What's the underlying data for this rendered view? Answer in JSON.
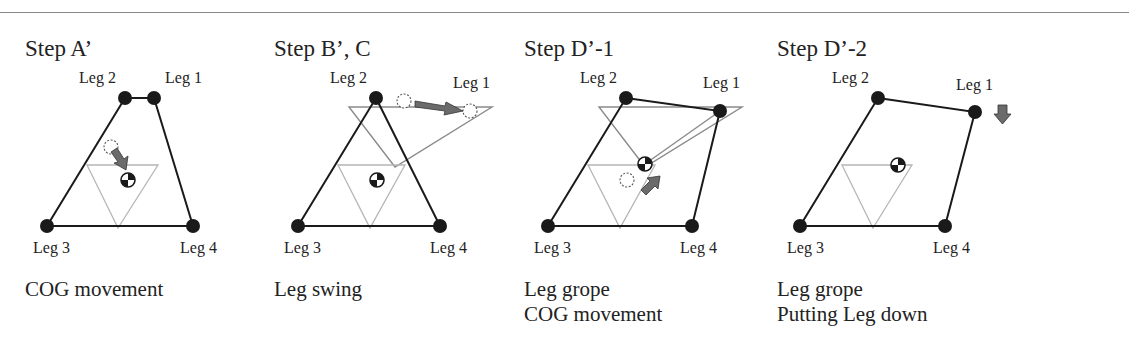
{
  "figure": {
    "panels": [
      {
        "id": "A",
        "title": "Step A’",
        "captions": [
          "COG movement"
        ],
        "legs": {
          "leg1": "Leg 1",
          "leg2": "Leg 2",
          "leg3": "Leg 3",
          "leg4": "Leg 4"
        }
      },
      {
        "id": "B",
        "title": "Step B’, C",
        "captions": [
          "Leg swing"
        ],
        "legs": {
          "leg1": "Leg 1",
          "leg2": "Leg 2",
          "leg3": "Leg 3",
          "leg4": "Leg 4"
        }
      },
      {
        "id": "D1",
        "title": "Step D’-1",
        "captions": [
          "Leg grope",
          "COG movement"
        ],
        "legs": {
          "leg1": "Leg 1",
          "leg2": "Leg 2",
          "leg3": "Leg 3",
          "leg4": "Leg 4"
        }
      },
      {
        "id": "D2",
        "title": "Step D’-2",
        "captions": [
          "Leg grope",
          "Putting Leg down"
        ],
        "legs": {
          "leg1": "Leg 1",
          "leg2": "Leg 2",
          "leg3": "Leg 3",
          "leg4": "Leg 4"
        }
      }
    ],
    "colors": {
      "support_polygon": "#1a1a1a",
      "stability_triangle": "#b5b5b5",
      "swing_triangle": "#8a8a8a",
      "arrow_fill": "#6b6b6b",
      "foot": "#1a1a1a"
    },
    "icons": [
      "foot-contact-dot",
      "cog-symbol",
      "dashed-previous-position-circle",
      "movement-arrow"
    ]
  }
}
